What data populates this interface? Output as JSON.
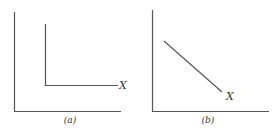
{
  "panels": [
    {
      "id": "a",
      "caption": "(a)",
      "curve_label": "X",
      "description": "L-shaped curve: vertical segment then horizontal segment"
    },
    {
      "id": "b",
      "caption": "(b)",
      "curve_label": "X",
      "description": "Straight downward-sloping line"
    }
  ],
  "colors": {
    "line": "#555555",
    "text": "#333333",
    "background": "#ffffff"
  }
}
